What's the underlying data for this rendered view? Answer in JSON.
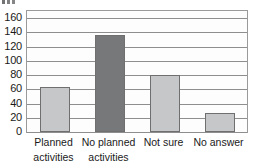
{
  "chart_data": {
    "type": "bar",
    "title": "",
    "subtitle": "",
    "xlabel": "",
    "ylabel": "",
    "categories": [
      "Planned activities",
      "No planned activities",
      "Not sure",
      "No answer"
    ],
    "category_lines": [
      [
        "Planned",
        "activities"
      ],
      [
        "No planned",
        "activities"
      ],
      [
        "Not sure",
        ""
      ],
      [
        "No answer",
        ""
      ]
    ],
    "values": [
      63,
      136,
      80,
      26
    ],
    "bar_colors": [
      "#c6c7c8",
      "#77787a",
      "#c6c7c8",
      "#c6c7c8"
    ],
    "ylim": [
      0,
      170
    ],
    "yticks": [
      0,
      20,
      40,
      60,
      80,
      100,
      120,
      140,
      160
    ],
    "ytick_labels": [
      "0",
      "20",
      "40",
      "60",
      "80",
      "100",
      "120",
      "140",
      "160"
    ],
    "grid": true,
    "grid_axis": "y",
    "legend": false,
    "legend_position": "none",
    "orientation": "vertical",
    "colors": {
      "bar_light": "#c6c7c8",
      "bar_dark": "#77787a",
      "bar_edge": "#6f6f6f",
      "gridline": "#8e8e8e",
      "frame": "#9a9a9a",
      "plot_background": "#fdfdfd",
      "text": "#1a1a1a",
      "page_background": "#ffffff"
    }
  }
}
